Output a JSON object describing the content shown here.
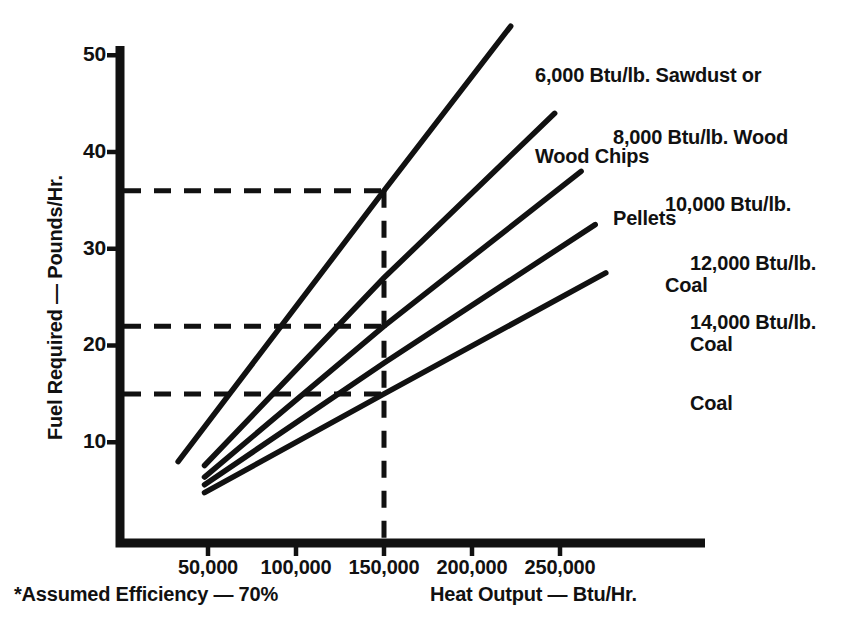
{
  "chart_data": {
    "type": "line",
    "title": "",
    "xlabel": "Heat Output — Btu/Hr.",
    "ylabel": "Fuel Required — Pounds/Hr.",
    "footnote": "*Assumed Efficiency — 70%",
    "grid": false,
    "legend_position": "inline-right-end-of-line",
    "xlim": [
      0,
      290000
    ],
    "ylim": [
      0,
      53
    ],
    "xticks": [
      50000,
      100000,
      150000,
      200000,
      250000
    ],
    "xtick_labels": [
      "50,000",
      "100,000",
      "150,000",
      "200,000",
      "250,000"
    ],
    "yticks": [
      10,
      20,
      30,
      40,
      50
    ],
    "ytick_labels": [
      "10",
      "20",
      "30",
      "40",
      "50"
    ],
    "series": [
      {
        "name": "6,000 Btu/lb. Sawdust or Wood Chips",
        "label_lines": [
          "6,000 Btu/lb. Sawdust or",
          "Wood Chips"
        ],
        "btu_per_lb": 6000,
        "x": [
          33000,
          150000,
          222000
        ],
        "y": [
          8.0,
          36.0,
          53.0
        ]
      },
      {
        "name": "8,000 Btu/lb. Wood Pellets",
        "label_lines": [
          "8,000 Btu/lb. Wood",
          "Pellets"
        ],
        "btu_per_lb": 8000,
        "x": [
          48000,
          150000,
          247000
        ],
        "y": [
          7.6,
          27.0,
          44.0
        ]
      },
      {
        "name": "10,000 Btu/lb. Coal",
        "label_lines": [
          "10,000 Btu/lb.",
          "Coal"
        ],
        "btu_per_lb": 10000,
        "x": [
          48000,
          150000,
          262000
        ],
        "y": [
          6.4,
          22.0,
          38.0
        ]
      },
      {
        "name": "12,000 Btu/lb. Coal",
        "label_lines": [
          "12,000 Btu/lb.",
          "Coal"
        ],
        "btu_per_lb": 12000,
        "x": [
          48000,
          150000,
          270000
        ],
        "y": [
          5.6,
          18.2,
          32.5
        ]
      },
      {
        "name": "14,000 Btu/lb. Coal",
        "label_lines": [
          "14,000 Btu/lb.",
          "Coal"
        ],
        "btu_per_lb": 14000,
        "x": [
          48000,
          150000,
          276000
        ],
        "y": [
          4.8,
          15.0,
          27.5
        ]
      }
    ],
    "reference_lines": {
      "vertical": {
        "x": 150000,
        "label": "150,000"
      },
      "horizontal": [
        {
          "y": 36.0,
          "meets_series": "6,000 Btu/lb. Sawdust or Wood Chips"
        },
        {
          "y": 22.0,
          "meets_series": "10,000 Btu/lb. Coal"
        },
        {
          "y": 15.0,
          "meets_series": "14,000 Btu/lb. Coal"
        }
      ]
    },
    "colors": {
      "background": "#ffffff",
      "ink": "#111111",
      "line": "#111111",
      "dashed": "#111111"
    }
  },
  "labels": {
    "y_axis_title": "Fuel Required — Pounds/Hr.",
    "x_axis_title": "Heat Output — Btu/Hr.",
    "footnote": "*Assumed Efficiency — 70%"
  }
}
